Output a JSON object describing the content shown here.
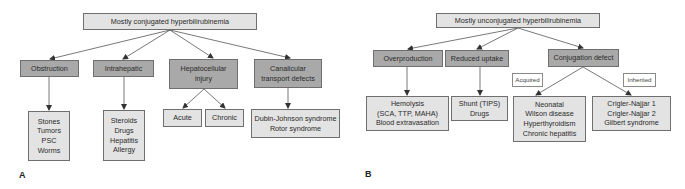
{
  "colors": {
    "root_fill": "#e3e3e3",
    "category_fill": "#a9a9a9",
    "leaf_fill": "#e3e3e3",
    "line": "#555555"
  },
  "panels": [
    {
      "letter": "A",
      "root": "Mostly conjugated hyperbilirubinemia",
      "categories": [
        {
          "label": "Obstruction",
          "children": [
            "Stones\nTumors\nPSC\nWorms"
          ]
        },
        {
          "label": "Intrahepatic",
          "children": [
            "Steroids\nDrugs\nHepatitis\nAllergy"
          ]
        },
        {
          "label": "Hepatocellular\ninjury",
          "children": [
            "Acute",
            "Chronic"
          ]
        },
        {
          "label": "Canalicular\ntransport defects",
          "children": [
            "Dubin-Johnson syndrome\nRotor syndrome"
          ]
        }
      ]
    },
    {
      "letter": "B",
      "root": "Mostly unconjugated hyperbilirubinemia",
      "categories": [
        {
          "label": "Overproduction",
          "children": [
            "Hemolysis\n(SCA, TTP, MAHA)\nBlood extravasation"
          ]
        },
        {
          "label": "Reduced uptake",
          "children": [
            "Shunt (TIPS)\nDrugs"
          ]
        },
        {
          "label": "Conjugation defect",
          "edge_labels": [
            "Acquired",
            "Inherited"
          ],
          "children": [
            "Neonatal\nWilson disease\nHyperthyroidism\nChronic hepatitis",
            "Crigler-Najjar 1\nCrigler-Najjar 2\nGilbert syndrome"
          ]
        }
      ]
    }
  ]
}
